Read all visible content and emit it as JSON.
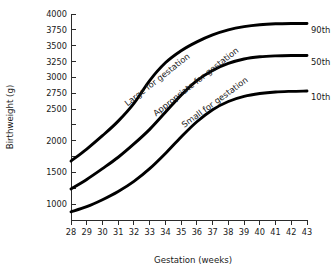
{
  "chart_data": {
    "type": "line",
    "title": "",
    "xlabel": "Gestation (weeks)",
    "ylabel": "Birthweight (g)",
    "xlim": [
      28,
      43
    ],
    "ylim": [
      750,
      4000
    ],
    "grid": false,
    "legend_position": "right-inline-end-labels",
    "x": [
      28,
      29,
      30,
      31,
      32,
      33,
      34,
      35,
      36,
      37,
      38,
      39,
      40,
      41,
      42,
      43
    ],
    "xticklabels": [
      "28",
      "29",
      "30",
      "31",
      "32",
      "33",
      "34",
      "35",
      "36",
      "37",
      "38",
      "39",
      "40",
      "41",
      "42",
      "43"
    ],
    "yticks": [
      1000,
      1250,
      1500,
      1750,
      2000,
      2250,
      2500,
      2750,
      3000,
      3250,
      3500,
      3750,
      4000
    ],
    "yticklabels_shown": [
      "1000",
      "1500",
      "2000",
      "2500",
      "2750",
      "3000",
      "3250",
      "3500",
      "3750",
      "4000"
    ],
    "series": [
      {
        "name": "90th",
        "end_label": "90th",
        "annotation": "Large for gestation",
        "values": [
          1680,
          1870,
          2080,
          2310,
          2590,
          2950,
          3230,
          3420,
          3560,
          3670,
          3750,
          3800,
          3830,
          3845,
          3850,
          3850
        ]
      },
      {
        "name": "50th",
        "end_label": "50th",
        "annotation": "Appropriate for gestation",
        "values": [
          1240,
          1390,
          1560,
          1740,
          1950,
          2180,
          2450,
          2720,
          2950,
          3110,
          3220,
          3290,
          3325,
          3340,
          3345,
          3345
        ]
      },
      {
        "name": "10th",
        "end_label": "10th",
        "annotation": "Small for gestation",
        "values": [
          880,
          960,
          1070,
          1200,
          1360,
          1560,
          1800,
          2060,
          2300,
          2490,
          2620,
          2700,
          2745,
          2770,
          2780,
          2785
        ]
      }
    ]
  }
}
